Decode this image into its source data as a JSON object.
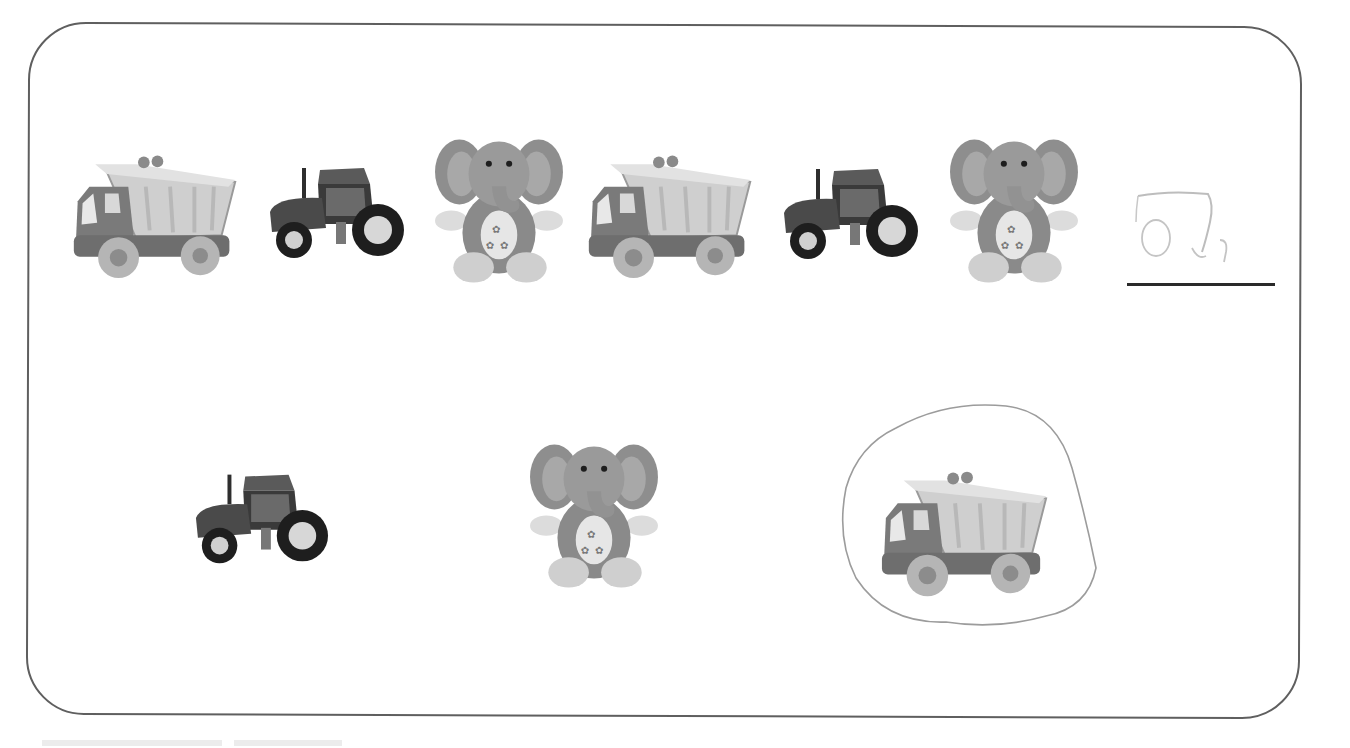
{
  "worksheet": {
    "task": "Pattern: what comes next",
    "colors": {
      "border": "#5f5f5f",
      "answer_line": "#2a2a2a",
      "pencil": "#b5b5b5"
    },
    "pattern_row": [
      {
        "toy": "dump-truck"
      },
      {
        "toy": "tractor"
      },
      {
        "toy": "elephant-plush"
      },
      {
        "toy": "dump-truck"
      },
      {
        "toy": "tractor"
      },
      {
        "toy": "elephant-plush"
      }
    ],
    "answer_blank": {
      "handwritten": "truck sketch"
    },
    "choices": [
      {
        "toy": "tractor",
        "selected": false
      },
      {
        "toy": "elephant-plush",
        "selected": false
      },
      {
        "toy": "dump-truck",
        "selected": true
      }
    ],
    "footer": ""
  }
}
